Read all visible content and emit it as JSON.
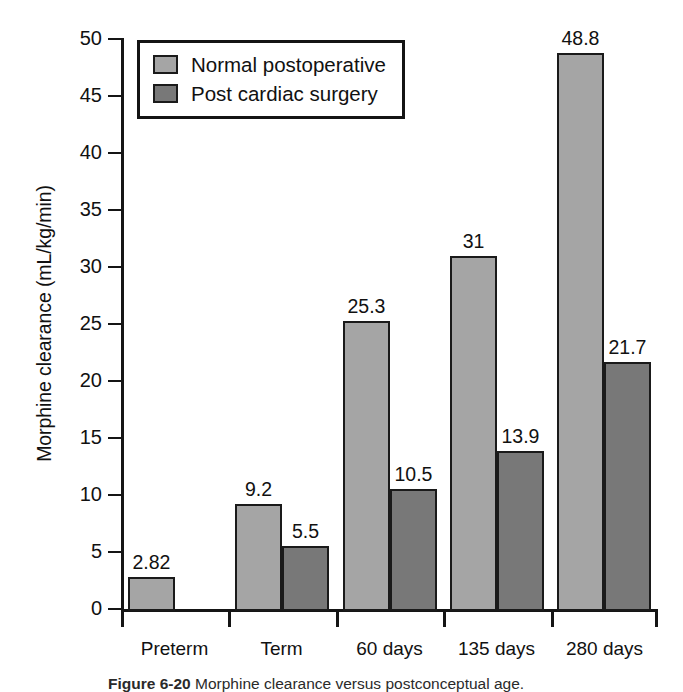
{
  "chart_data": {
    "type": "bar",
    "title": "",
    "xlabel": "",
    "ylabel": "Morphine clearance (mL/kg/min)",
    "ylim": [
      0,
      50
    ],
    "yticks": [
      0,
      5,
      10,
      15,
      20,
      25,
      30,
      35,
      40,
      45,
      50
    ],
    "ytick_labels": [
      "0",
      "5",
      "10",
      "15",
      "20",
      "25",
      "30",
      "35",
      "40",
      "45",
      "50"
    ],
    "grid": false,
    "legend_position": "upper-left-inside",
    "categories": [
      "Preterm",
      "Term",
      "60 days",
      "135 days",
      "280 days"
    ],
    "series": [
      {
        "name": "Normal postoperative",
        "color": "#a5a5a5",
        "values": [
          2.82,
          9.2,
          25.3,
          31,
          48.8
        ],
        "labels": [
          "2.82",
          "9.2",
          "25.3",
          "31",
          "48.8"
        ]
      },
      {
        "name": "Post cardiac surgery",
        "color": "#787878",
        "values": [
          null,
          5.5,
          10.5,
          13.9,
          21.7
        ],
        "labels": [
          "",
          "5.5",
          "10.5",
          "13.9",
          "21.7"
        ]
      }
    ]
  },
  "legend": {
    "entries": [
      {
        "label": "Normal postoperative",
        "color": "#a5a5a5"
      },
      {
        "label": "Post cardiac surgery",
        "color": "#787878"
      }
    ]
  },
  "caption": {
    "label": "Figure 6-20",
    "text": "Morphine clearance versus postconceptual age."
  }
}
